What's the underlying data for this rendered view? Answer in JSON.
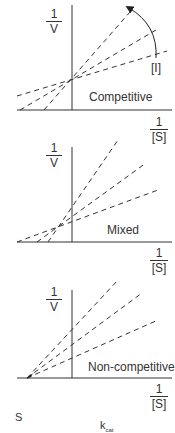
{
  "panels": [
    {
      "name": "competitive",
      "title": "Competitive",
      "y_label": {
        "num": "1",
        "den": "V"
      },
      "x_label": {
        "num": "1",
        "den": "[S]"
      },
      "arrow_label": "[I]"
    },
    {
      "name": "mixed",
      "title": "Mixed",
      "y_label": {
        "num": "1",
        "den": "V"
      },
      "x_label": {
        "num": "1",
        "den": "[S]"
      }
    },
    {
      "name": "non-competitive",
      "title": "Non-competitive",
      "y_label": {
        "num": "1",
        "den": "V"
      },
      "x_label": {
        "num": "1",
        "den": "[S]"
      }
    }
  ],
  "footer": {
    "left_text": "S",
    "right_text": "k",
    "right_sub": "cat"
  },
  "colors": {
    "line": "#333333",
    "background": "#ffffff"
  }
}
